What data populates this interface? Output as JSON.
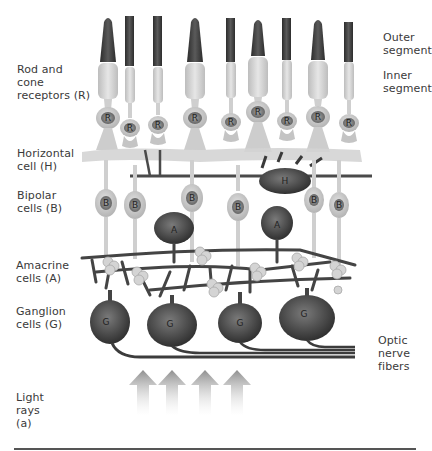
{
  "figure": {
    "panel_label": "(a)",
    "labels_left": {
      "receptors": "Rod and\ncone\nreceptors (R)",
      "horizontal": "Horizontal\ncell (H)",
      "bipolar": "Bipolar\ncells (B)",
      "amacrine": "Amacrine\ncells (A)",
      "ganglion": "Ganglion\ncells (G)",
      "light": "Light\nrays\n(a)"
    },
    "labels_right": {
      "outer_segment": "Outer\nsegment",
      "inner_segment": "Inner\nsegment",
      "optic_nerve": "Optic\nnerve\nfibers"
    },
    "cell_letters": {
      "receptor": "R",
      "horizontal": "H",
      "bipolar": "B",
      "amacrine": "A",
      "ganglion": "G"
    },
    "counts": {
      "receptors": 9,
      "bipolar": 7,
      "amacrine": 2,
      "horizontal": 1,
      "ganglion": 4,
      "light_arrows": 4
    },
    "colors": {
      "outer_segment": "#3a3a3a",
      "inner_segment": "#d6d6d6",
      "cell_body": "#c9c9c9",
      "nucleus": "#8a8a8a",
      "dark_cell": "#4a4a4a",
      "fiber": "#444444",
      "arrow": "#9a9a9a",
      "text": "#3a3a3a"
    }
  }
}
